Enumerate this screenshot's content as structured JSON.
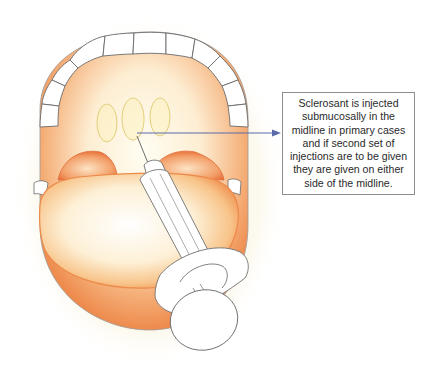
{
  "figure": {
    "callout": {
      "text": "Sclerosant is injected\nsubmucosally in the\nmidline in primary cases\nand if second set of\ninjections are to be given\nthey are given on either\nside of the midline."
    },
    "labels": {
      "injection_sites": [
        "left-of-midline",
        "midline",
        "right-of-midline"
      ]
    },
    "colors": {
      "tissue_orange": "#f0945a",
      "tissue_light": "#fbe6c8",
      "tissue_yellow": "#f6e7a8",
      "teeth_outline": "#6a6a6a",
      "arrow": "#5b6aa8",
      "box_border": "#8e8e8e"
    }
  }
}
